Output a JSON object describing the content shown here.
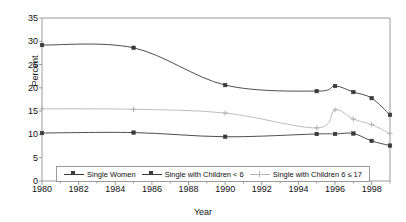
{
  "chart_data": {
    "type": "line",
    "title": "",
    "xlabel": "Year",
    "ylabel": "Percent",
    "xlim": [
      1980,
      1999
    ],
    "ylim": [
      0,
      35
    ],
    "ytick_step": 5,
    "yticks": [
      0,
      5,
      10,
      15,
      20,
      25,
      30,
      35
    ],
    "xticks": [
      1980,
      1982,
      1984,
      1986,
      1988,
      1990,
      1992,
      1994,
      1996,
      1998
    ],
    "x": [
      1980,
      1985,
      1990,
      1995,
      1996,
      1997,
      1998,
      1999
    ],
    "grid": false,
    "legend_position": "bottom-inside",
    "series": [
      {
        "name": "Single Women",
        "color": "#3a3a3a",
        "marker": "square",
        "values": [
          29.2,
          28.6,
          20.6,
          19.3,
          20.4,
          19.1,
          17.8,
          14.2
        ]
      },
      {
        "name": "Single with Children < 6",
        "color": "#3a3a3a",
        "marker": "square",
        "values": [
          10.3,
          10.4,
          9.5,
          10.1,
          10.1,
          10.2,
          8.6,
          7.6
        ]
      },
      {
        "name": "Single with Children 6 ≤ 17",
        "color": "#b5b5b5",
        "marker": "plus",
        "values": [
          15.5,
          15.4,
          14.6,
          11.4,
          15.3,
          13.3,
          12.1,
          10.2
        ]
      }
    ]
  },
  "axes": {
    "y_title": "Percent",
    "x_title": "Year",
    "ytick_labels": [
      "0",
      "5",
      "10",
      "15",
      "20",
      "25",
      "30",
      "35"
    ],
    "xtick_labels": [
      "1980",
      "1982",
      "1984",
      "1986",
      "1988",
      "1990",
      "1992",
      "1994",
      "1996",
      "1998"
    ]
  },
  "legend": {
    "items": [
      {
        "label": "Single Women"
      },
      {
        "label": "Single with Children < 6"
      },
      {
        "label": "Single with Children 6 ≤ 17"
      }
    ]
  },
  "colors": {
    "frame": "#9a9a9a",
    "dark_series": "#3a3a3a",
    "light_series": "#b5b5b5",
    "background": "#ffffff",
    "text": "#111111"
  }
}
